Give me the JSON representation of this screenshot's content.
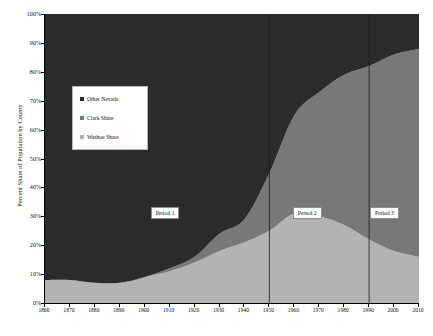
{
  "chart_data": {
    "type": "area",
    "stacked": true,
    "title": "",
    "xlabel": "",
    "ylabel": "Percent Share of Population by County",
    "xlim": [
      1860,
      2010
    ],
    "ylim": [
      0,
      1
    ],
    "grid": false,
    "legend_position": "upper-left-inside",
    "x": [
      1860,
      1870,
      1880,
      1890,
      1900,
      1910,
      1920,
      1930,
      1940,
      1950,
      1960,
      1970,
      1980,
      1990,
      2000,
      2010
    ],
    "xticklabels": [
      "1860",
      "1870",
      "1880",
      "1890",
      "1900",
      "1910",
      "1920",
      "1930",
      "1940",
      "1950",
      "1960",
      "1970",
      "1980",
      "1990",
      "2000",
      "2010"
    ],
    "yticklabels": [
      "0%",
      "10%",
      "20%",
      "30%",
      "40%",
      "50%",
      "60%",
      "70%",
      "80%",
      "90%",
      "100%"
    ],
    "series": [
      {
        "name": "Washoe Share",
        "color": "#b3b3b3",
        "values": [
          8,
          8,
          7,
          7,
          9,
          11,
          14,
          18,
          21,
          25,
          31,
          30,
          27,
          22,
          18,
          16
        ]
      },
      {
        "name": "Clark Share",
        "color": "#787878",
        "values": [
          0,
          0,
          0,
          0,
          0,
          1,
          2,
          6,
          8,
          20,
          34,
          43,
          52,
          60,
          68,
          72
        ]
      },
      {
        "name": "Other Nevada",
        "color": "#2b2b2b",
        "values": [
          92,
          92,
          93,
          93,
          91,
          88,
          84,
          76,
          71,
          55,
          35,
          27,
          21,
          18,
          14,
          12
        ]
      }
    ],
    "annotations": [
      {
        "label": "Period 1",
        "x": 1910,
        "y": 0.31
      },
      {
        "label": "Period 2",
        "x": 1967,
        "y": 0.31
      },
      {
        "label": "Period 3",
        "x": 1998,
        "y": 0.31
      }
    ],
    "dividers": [
      {
        "x": 1950
      },
      {
        "x": 1990
      }
    ]
  },
  "legend": {
    "items": [
      {
        "label": "Other Nevada",
        "color": "#2b2b2b"
      },
      {
        "label": "Clark Share",
        "color": "#787878"
      },
      {
        "label": "Washoe Share",
        "color": "#b3b3b3"
      }
    ]
  }
}
